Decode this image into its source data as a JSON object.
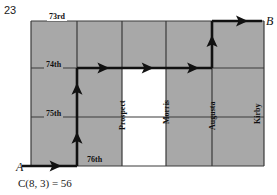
{
  "figure": {
    "problem_number": "23",
    "caption": {
      "function": "C",
      "full": "C(8, 3) = 56",
      "args": "(8, 3)",
      "equals": "=",
      "result": "56"
    },
    "nodes": [
      {
        "id": "start",
        "label": "A",
        "x": 16,
        "y": 160
      },
      {
        "id": "end",
        "label": "B",
        "x": 266,
        "y": 14
      }
    ],
    "horizontal_streets": [
      {
        "name": "73rd",
        "label": "73rd",
        "y": 21,
        "label_x": 47,
        "label_y": 12
      },
      {
        "name": "74th",
        "label": "74th",
        "y": 68,
        "label_x": 44,
        "label_y": 60
      },
      {
        "name": "75th",
        "label": "75th",
        "y": 117,
        "label_x": 44,
        "label_y": 109
      },
      {
        "name": "76th",
        "label": "76th",
        "y": 166,
        "label_x": 85,
        "label_y": 155
      }
    ],
    "vertical_streets": [
      {
        "name": "Prospect",
        "label": "Prospect",
        "x": 122,
        "label_x": 118,
        "label_y": 130
      },
      {
        "name": "Morris",
        "label": "Morris",
        "x": 166,
        "label_x": 162,
        "label_y": 124
      },
      {
        "name": "Augusta",
        "label": "Augusta",
        "x": 212,
        "label_x": 208,
        "label_y": 130
      },
      {
        "name": "Kirby",
        "label": "Kirby",
        "x": 264,
        "label_x": 253,
        "label_y": 124
      }
    ],
    "grid": {
      "x_lines": [
        31,
        77,
        122,
        166,
        212,
        264
      ],
      "y_lines": [
        21,
        68,
        117,
        166
      ],
      "fill_color": "#a8a8a8",
      "line_color": "#3a3a3a",
      "blank_color": "#ffffff"
    },
    "blank_region": {
      "x": 122,
      "y": 68,
      "width": 44,
      "height": 98
    },
    "path": {
      "color": "#111111",
      "description": "A east to Prospect-side, north two blocks to 74th, east three blocks to Augusta, north one block to 73rd, east to B",
      "segments": [
        {
          "dir": "east",
          "x1": 22,
          "y1": 166,
          "x2": 77,
          "y2": 166
        },
        {
          "dir": "north",
          "x1": 77,
          "y1": 166,
          "x2": 77,
          "y2": 117
        },
        {
          "dir": "north",
          "x1": 77,
          "y1": 117,
          "x2": 77,
          "y2": 68
        },
        {
          "dir": "east",
          "x1": 77,
          "y1": 68,
          "x2": 122,
          "y2": 68
        },
        {
          "dir": "east",
          "x1": 122,
          "y1": 68,
          "x2": 166,
          "y2": 68
        },
        {
          "dir": "east",
          "x1": 166,
          "y1": 68,
          "x2": 212,
          "y2": 68
        },
        {
          "dir": "north",
          "x1": 212,
          "y1": 68,
          "x2": 212,
          "y2": 21
        },
        {
          "dir": "east",
          "x1": 212,
          "y1": 21,
          "x2": 262,
          "y2": 21
        }
      ]
    }
  }
}
